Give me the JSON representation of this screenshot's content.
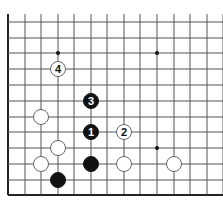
{
  "diagram": {
    "type": "go-board-fragment",
    "grid": {
      "columns_x": [
        8,
        25,
        41,
        58,
        74,
        91,
        107,
        124,
        140,
        157,
        174,
        190,
        207,
        223
      ],
      "rows_y": [
        22,
        38,
        53,
        69,
        85,
        101,
        117,
        132,
        148,
        164,
        180,
        195
      ],
      "left_edge": true,
      "bottom_edge": true,
      "line_color": "#555555",
      "edge_color": "#222222"
    },
    "star_points": [
      {
        "col": 3,
        "row": 2
      },
      {
        "col": 9,
        "row": 2
      },
      {
        "col": 9,
        "row": 8
      }
    ],
    "stones": [
      {
        "color": "white",
        "col": 3,
        "row": 3,
        "label": "4"
      },
      {
        "color": "black",
        "col": 5,
        "row": 5,
        "label": "3"
      },
      {
        "color": "white",
        "col": 2,
        "row": 6,
        "label": ""
      },
      {
        "color": "black",
        "col": 5,
        "row": 7,
        "label": "1"
      },
      {
        "color": "white",
        "col": 7,
        "row": 7,
        "label": "2"
      },
      {
        "color": "white",
        "col": 3,
        "row": 8,
        "label": ""
      },
      {
        "color": "white",
        "col": 2,
        "row": 9,
        "label": ""
      },
      {
        "color": "black",
        "col": 5,
        "row": 9,
        "label": ""
      },
      {
        "color": "white",
        "col": 7,
        "row": 9,
        "label": ""
      },
      {
        "color": "white",
        "col": 10,
        "row": 9,
        "label": ""
      },
      {
        "color": "black",
        "col": 3,
        "row": 10,
        "label": ""
      }
    ],
    "colors": {
      "black_stone": "#111111",
      "white_stone": "#ffffff",
      "white_stroke": "#666666",
      "black_label": "#ffffff",
      "white_label": "#111111"
    }
  }
}
